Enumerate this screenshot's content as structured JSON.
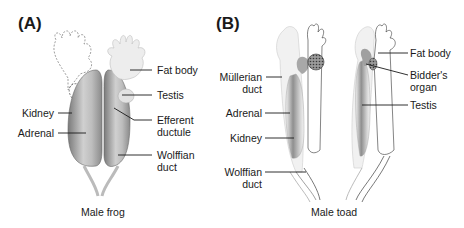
{
  "panels": {
    "a": {
      "letter": "(A)",
      "caption": "Male frog",
      "labels": {
        "fat_body": "Fat body",
        "testis": "Testis",
        "efferent_1": "Efferent",
        "efferent_2": "ductule",
        "wolffian_1": "Wolffian",
        "wolffian_2": "duct",
        "kidney": "Kidney",
        "adrenal": "Adrenal"
      }
    },
    "b": {
      "letter": "(B)",
      "caption": "Male toad",
      "labels": {
        "mullerian_1": "Müllerian",
        "mullerian_2": "duct",
        "adrenal": "Adrenal",
        "kidney": "Kidney",
        "wolffian_1": "Wolffian",
        "wolffian_2": "duct",
        "fat_body": "Fat body",
        "bidders_1": "Bidder's",
        "bidders_2": "organ",
        "testis": "Testis"
      }
    }
  },
  "colors": {
    "kidney_dark": "#8a8a8a",
    "kidney_light": "#d8d8d8",
    "fat_body": "#ececec",
    "leader_line": "#1a1a1a"
  }
}
